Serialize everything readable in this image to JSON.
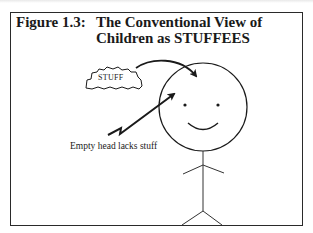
{
  "figure": {
    "label": "Figure 1.3:",
    "title_line1": "The Conventional View of",
    "title_line2": "Children as STUFFEES"
  },
  "diagram": {
    "cloud_text": "STUFF",
    "caption": "Empty head lacks stuff",
    "elements": [
      {
        "id": "stuff-cloud",
        "type": "cloud",
        "label": "STUFF"
      },
      {
        "id": "curved-arrow",
        "type": "arrow",
        "from": "stuff-cloud",
        "to": "head"
      },
      {
        "id": "lightning-arrow",
        "type": "arrow",
        "from": "caption",
        "to": "head"
      },
      {
        "id": "head",
        "type": "circle",
        "features": [
          "two eyes",
          "smile"
        ]
      },
      {
        "id": "stick-body",
        "type": "stick-figure",
        "parts": [
          "torso",
          "arms",
          "legs"
        ]
      }
    ]
  },
  "colors": {
    "ink": "#1a1a1a",
    "frame": "#2a2a2a",
    "background": "#ffffff"
  }
}
